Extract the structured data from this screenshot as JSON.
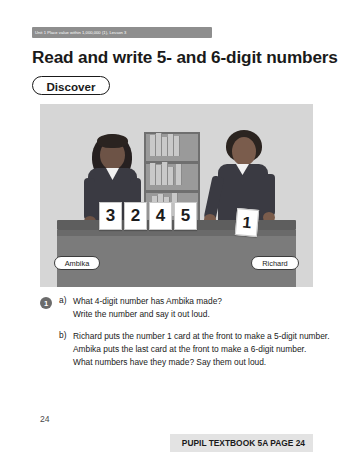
{
  "header": {
    "strip_text": "Unit 1  Place value within 1,000,000 (1), Lesson 3"
  },
  "title": "Read and write 5- and 6-digit numbers",
  "discover": {
    "label": "Discover"
  },
  "illustration": {
    "cards": [
      "3",
      "2",
      "4",
      "5"
    ],
    "single_card": "1",
    "labels": {
      "left": "Ambika",
      "right": "Richard"
    }
  },
  "question": {
    "number": "1",
    "items": [
      {
        "letter": "a)",
        "lines": [
          "What 4-digit number has Ambika made?",
          "Write the number and say it out loud."
        ]
      },
      {
        "letter": "b)",
        "lines": [
          "Richard puts the number 1 card at the front to make a 5-digit number.",
          "Ambika puts the last card at the front to make a 6-digit number.",
          "What numbers have they made? Say them out loud."
        ]
      }
    ]
  },
  "footer": {
    "page_number": "24",
    "label": "PUPIL TEXTBOOK 5A  PAGE 24"
  },
  "colors": {
    "header_strip": "#8e8e8e",
    "footer_bar": "#e3e3e3",
    "illustration_bg": "#d6d6d6"
  }
}
